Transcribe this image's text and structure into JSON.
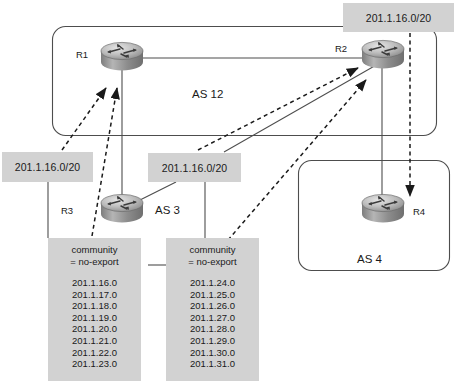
{
  "diagram": {
    "autonomous_systems": [
      {
        "id": "as12",
        "label": "AS 12",
        "routers": [
          "R1",
          "R2"
        ]
      },
      {
        "id": "as3",
        "label": "AS 3",
        "routers": [
          "R3"
        ]
      },
      {
        "id": "as4",
        "label": "AS 4",
        "routers": [
          "R4"
        ]
      }
    ],
    "routers": [
      {
        "id": "r1",
        "label": "R1"
      },
      {
        "id": "r2",
        "label": "R2"
      },
      {
        "id": "r3",
        "label": "R3"
      },
      {
        "id": "r4",
        "label": "R4"
      }
    ],
    "route_labels": [
      {
        "id": "top-right",
        "text": "201.1.16.0/20"
      },
      {
        "id": "left",
        "text": "201.1.16.0/20"
      },
      {
        "id": "middle",
        "text": "201.1.16.0/20"
      }
    ],
    "community_boxes": [
      {
        "id": "left-community",
        "line1": "community",
        "line2": "= no-export",
        "prefixes": [
          "201.1.16.0",
          "201.1.17.0",
          "201.1.18.0",
          "201.1.19.0",
          "201.1.20.0",
          "201.1.21.0",
          "201.1.22.0",
          "201.1.23.0"
        ]
      },
      {
        "id": "right-community",
        "line1": "community",
        "line2": "= no-export",
        "prefixes": [
          "201.1.24.0",
          "201.1.25.0",
          "201.1.26.0",
          "201.1.27.0",
          "201.1.28.0",
          "201.1.29.0",
          "201.1.30.0",
          "201.1.31.0"
        ]
      }
    ],
    "colors": {
      "label_fill": "#d2d2d2",
      "line": "#4d4d4d",
      "text": "#1a1a1a",
      "router_body": "#9a9a9a"
    }
  }
}
